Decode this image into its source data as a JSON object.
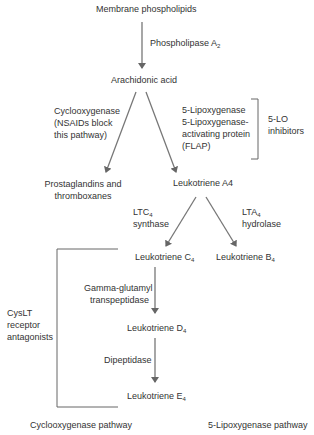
{
  "nodes": {
    "membrane": "Membrane phospholipids",
    "arachidonic": "Arachidonic acid",
    "prostaglandins_1": "Prostaglandins and",
    "prostaglandins_2": "thromboxanes",
    "lta4": "Leukotriene A4",
    "ltc4": "Leukotriene C",
    "ltc4_sub": "4",
    "ltb4": "Leukotriene B",
    "ltb4_sub": "4",
    "ltd4": "Leukotriene D",
    "ltd4_sub": "4",
    "lte4": "Leukotriene E",
    "lte4_sub": "4"
  },
  "enzymes": {
    "pla2": "Phospholipase A",
    "pla2_sub": "2",
    "cox_1": "Cyclooxygenase",
    "cox_2": "(NSAIDs block",
    "cox_3": "this pathway)",
    "lox_1": "5-Lipoxygenase",
    "lox_2": "5-Lipoxygenase-",
    "lox_3": "activating protein",
    "lox_4": "(FLAP)",
    "ltc4s_1": "LTC",
    "ltc4s_sub": "4",
    "ltc4s_2": "synthase",
    "lta4h_1": "LTA",
    "lta4h_sub": "4",
    "lta4h_2": "hydrolase",
    "ggt_1": "Gamma-glutamyl",
    "ggt_2": "transpeptidase",
    "dipeptidase": "Dipeptidase"
  },
  "inhibitors": {
    "lo_1": "5-LO",
    "lo_2": "inhibitors",
    "cyslt_1": "CysLT",
    "cyslt_2": "receptor",
    "cyslt_3": "antagonists"
  },
  "footer": {
    "left": "Cyclooxygenase pathway",
    "right": "5-Lipoxygenase pathway"
  },
  "colors": {
    "text": "#333333",
    "arrow": "#666666"
  }
}
